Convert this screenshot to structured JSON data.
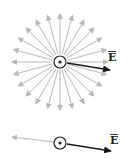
{
  "figures": [
    {
      "name": "radial-field",
      "field_lines": 24,
      "field_color": "#b8b8b8",
      "charge_symbol": "dot-in-circle",
      "vector_label": "E",
      "vector_color": "#1a1a1a"
    },
    {
      "name": "single-line-field",
      "field_lines": 1,
      "field_color": "#b8b8b8",
      "charge_symbol": "dot-in-circle",
      "vector_label": "E",
      "vector_color": "#1a1a1a"
    }
  ]
}
